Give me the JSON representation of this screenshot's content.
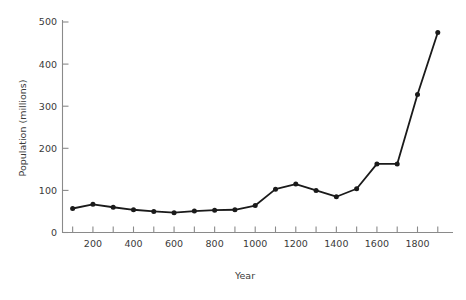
{
  "chart_data": {
    "type": "line",
    "title": "",
    "xlabel": "Year",
    "ylabel": "Population (millions)",
    "xlim": [
      50,
      1975
    ],
    "ylim": [
      0,
      520
    ],
    "grid": false,
    "legend": null,
    "marker": "filled-circle",
    "line_color": "#1a1a1a",
    "marker_color": "#1a1a1a",
    "axis_color": "#808080",
    "text_color": "#3a3a3a",
    "x_ticks_major": [
      200,
      400,
      600,
      800,
      1000,
      1200,
      1400,
      1600,
      1800
    ],
    "x_ticks_minor": [
      100,
      300,
      500,
      700,
      900,
      1100,
      1300,
      1500,
      1700,
      1900
    ],
    "x_tick_labels": [
      "200",
      "400",
      "600",
      "800",
      "1000",
      "1200",
      "1400",
      "1600",
      "1800"
    ],
    "y_ticks": [
      0,
      100,
      200,
      300,
      400,
      500
    ],
    "y_tick_labels": [
      "0",
      "100",
      "200",
      "300",
      "400",
      "500"
    ],
    "x": [
      100,
      200,
      300,
      400,
      500,
      600,
      700,
      800,
      900,
      1000,
      1100,
      1200,
      1300,
      1400,
      1500,
      1600,
      1700,
      1800,
      1900
    ],
    "values": [
      57,
      67,
      60,
      54,
      50,
      47,
      51,
      53,
      54,
      64,
      103,
      115,
      100,
      85,
      104,
      163,
      163,
      328,
      475
    ],
    "series": [
      {
        "name": "World population",
        "values": [
          57,
          67,
          60,
          54,
          50,
          47,
          51,
          53,
          54,
          64,
          103,
          115,
          100,
          85,
          104,
          163,
          163,
          328,
          475
        ]
      }
    ]
  }
}
